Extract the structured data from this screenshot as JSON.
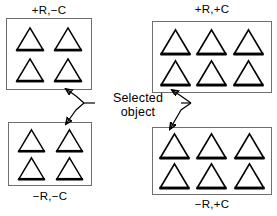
{
  "figure": {
    "caption_line1": "Selected",
    "caption_line2": "object",
    "background_color": "#ffffff",
    "ink_color": "#000000",
    "panel_border_color": "#6e6e6e"
  },
  "panels": [
    {
      "id": "top-left",
      "label": "+R,−C",
      "label_position": "above",
      "rows": 2,
      "cols": 2,
      "object_count": 4,
      "object_shape": "triangle",
      "selected_object_index": 3,
      "selected_object_position": "bottom-right"
    },
    {
      "id": "top-right",
      "label": "+R,+C",
      "label_position": "above",
      "rows": 2,
      "cols": 3,
      "object_count": 6,
      "object_shape": "triangle",
      "selected_object_index": 3,
      "selected_object_position": "bottom-left"
    },
    {
      "id": "bottom-left",
      "label": "−R,−C",
      "label_position": "below",
      "rows": 2,
      "cols": 2,
      "object_count": 4,
      "object_shape": "triangle",
      "selected_object_index": 1,
      "selected_object_position": "top-right"
    },
    {
      "id": "bottom-right",
      "label": "−R,+C",
      "label_position": "below",
      "rows": 2,
      "cols": 3,
      "object_count": 6,
      "object_shape": "triangle",
      "selected_object_index": 0,
      "selected_object_position": "top-left"
    }
  ],
  "connectors": [
    {
      "id": "leader-top-left",
      "from": "caption",
      "to": "top-left-selected-triangle",
      "arrowhead": true
    },
    {
      "id": "leader-bottom-left",
      "from": "caption",
      "to": "bottom-left-selected-triangle",
      "arrowhead": true
    },
    {
      "id": "leader-top-right",
      "from": "caption",
      "to": "top-right-selected-triangle",
      "arrowhead": true
    },
    {
      "id": "leader-bottom-right",
      "from": "caption",
      "to": "bottom-right-selected-triangle",
      "arrowhead": true
    }
  ]
}
